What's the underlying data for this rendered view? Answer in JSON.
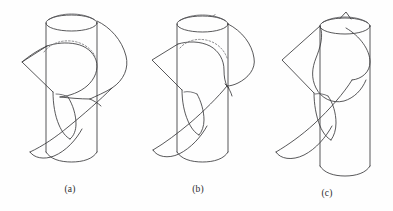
{
  "figure": {
    "background_color": "#fefefe",
    "line_color": "#3a3a3c",
    "hidden_line_color": "#6e6e72",
    "caption_color": "#2b2b2d",
    "panels": [
      {
        "id": "a",
        "label": "(a)",
        "description": "Cylinder with ribbon surface wrapping around it; closed intersection curve shown with hidden dashed arc on the far side of the cylinder near the top.",
        "elements": {
          "cylinder": "vertical-cylinder",
          "top_ellipse": "open-top-rim",
          "bottom_ellipse": "bottom-rim",
          "ribbon": "helical-band",
          "hidden_arc": "dashed-occluded-intersection",
          "left_cusp": "ribbon-left-corner"
        }
      },
      {
        "id": "b",
        "label": "(b)",
        "description": "Same cylinder with the ribbon surface pinching; the intersection curve has contracted and the dashed hidden arc is shorter.",
        "elements": {
          "cylinder": "vertical-cylinder",
          "top_ellipse": "open-top-rim",
          "bottom_ellipse": "bottom-rim",
          "ribbon": "helical-band",
          "hidden_arc": "dashed-occluded-intersection",
          "tangency_point": "pinch-point"
        }
      },
      {
        "id": "c",
        "label": "(c)",
        "description": "The loop has collapsed to a single cusp point at the top of the cylinder; no dashed hidden arc remains, only a small spike at the top rim.",
        "elements": {
          "cylinder": "vertical-cylinder",
          "top_ellipse": "open-top-rim",
          "bottom_ellipse": "bottom-rim",
          "ribbon": "helical-band",
          "cusp": "top-cusp-spike"
        }
      }
    ]
  }
}
